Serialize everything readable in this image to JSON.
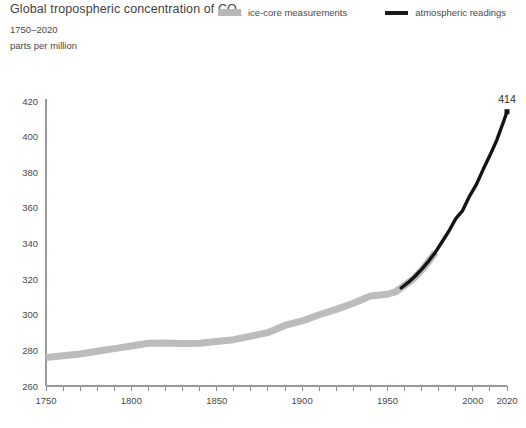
{
  "header": {
    "title_prefix": "Global tropospheric concentration of CO",
    "title_sub": "2",
    "subtitle": "1750–2020",
    "units": "parts per million"
  },
  "legend": {
    "items": [
      {
        "label": "ice-core measurements",
        "swatch": "icecore-band",
        "color": "#b8b8b8"
      },
      {
        "label": "atmospheric readings",
        "swatch": "atmos-line",
        "color": "#1a1a1a"
      }
    ]
  },
  "annotation": {
    "endpoint_value": "414"
  },
  "chart_data": {
    "type": "line",
    "title": "Global tropospheric concentration of CO2",
    "subtitle": "1750–2020",
    "xlabel": "",
    "ylabel": "parts per million",
    "xlim": [
      1750,
      2020
    ],
    "ylim": [
      260,
      420
    ],
    "xticks": [
      1750,
      1760,
      1770,
      1780,
      1790,
      1800,
      1810,
      1820,
      1830,
      1840,
      1850,
      1860,
      1870,
      1880,
      1890,
      1900,
      1910,
      1920,
      1930,
      1940,
      1950,
      1960,
      1970,
      1980,
      1990,
      2000,
      2010,
      2020
    ],
    "xticklabels": [
      "1750",
      "1800",
      "1850",
      "1900",
      "1950",
      "2000",
      "2020"
    ],
    "xticklabel_values": [
      1750,
      1800,
      1850,
      1900,
      1950,
      2000,
      2020
    ],
    "yticks": [
      260,
      280,
      300,
      320,
      340,
      360,
      380,
      400,
      420
    ],
    "yticklabels": [
      "260",
      "280",
      "300",
      "320",
      "340",
      "360",
      "380",
      "400",
      "420"
    ],
    "grid": false,
    "legend_position": "top-right",
    "series": [
      {
        "name": "ice-core measurements",
        "color": "#bcbcbc",
        "style": "thick-band",
        "x": [
          1750,
          1760,
          1770,
          1780,
          1790,
          1800,
          1810,
          1820,
          1830,
          1840,
          1850,
          1860,
          1870,
          1880,
          1890,
          1900,
          1910,
          1920,
          1930,
          1940,
          1950,
          1955,
          1960,
          1965,
          1970,
          1975,
          1978
        ],
        "values": [
          276.0,
          277.0,
          278.0,
          279.5,
          281.0,
          282.5,
          284.0,
          284.2,
          283.8,
          284.0,
          285.0,
          286.0,
          288.0,
          290.0,
          294.0,
          296.5,
          300.0,
          303.0,
          306.5,
          310.5,
          311.5,
          313.0,
          316.5,
          320.0,
          325.0,
          331.0,
          335.0
        ]
      },
      {
        "name": "atmospheric readings",
        "color": "#151515",
        "style": "line",
        "x": [
          1958,
          1962,
          1966,
          1970,
          1974,
          1978,
          1982,
          1986,
          1990,
          1994,
          1998,
          2002,
          2006,
          2010,
          2014,
          2018,
          2020
        ],
        "values": [
          315.0,
          318.0,
          321.5,
          325.5,
          330.0,
          335.0,
          341.0,
          347.0,
          354.0,
          358.5,
          366.5,
          373.0,
          381.5,
          389.5,
          398.0,
          408.5,
          414.0
        ]
      }
    ],
    "annotations": [
      {
        "text": "414",
        "x": 2020,
        "y": 414,
        "marker": "square"
      }
    ]
  }
}
